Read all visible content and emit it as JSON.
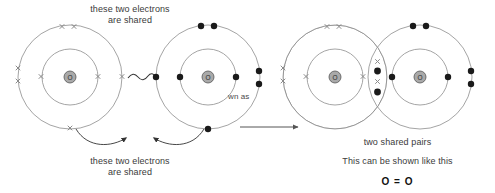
{
  "diagram": {
    "captions": {
      "top": "these two electrons\nare shared",
      "top_line1": "these two electrons",
      "top_line2": "are shared",
      "bottom_line1": "these two electrons",
      "bottom_line2": "are shared",
      "shown_as": "wn as",
      "two_shared_pairs": "two shared pairs",
      "shown_like_this": "This can be shown like this",
      "formula": "O = O"
    },
    "colors": {
      "shell_stroke": "#8d8d8d",
      "nucleus_fill": "#a9a9a9",
      "nucleus_stroke": "#555555",
      "dot_electron": "#1a1a1a",
      "cross_electron": "#8a8a8a",
      "arrow": "#555555",
      "text": "#3a3a3a",
      "formula_text": "#111111"
    },
    "left_group": {
      "label": "separate atoms",
      "atom_a": {
        "symbol": "O",
        "electron_mark": "cross",
        "cx": 70,
        "cy": 77,
        "inner_r": 28,
        "outer_r": 52,
        "inner_electrons": [
          {
            "angle": 180
          },
          {
            "angle": 0
          }
        ],
        "outer_electrons": [
          {
            "angle": 97
          },
          {
            "angle": 83
          },
          {
            "angle": 186
          },
          {
            "angle": 174
          },
          {
            "angle": 270
          },
          {
            "angle": 0
          }
        ]
      },
      "atom_b": {
        "symbol": "O",
        "electron_mark": "dot",
        "cx": 208,
        "cy": 77,
        "inner_r": 28,
        "outer_r": 52,
        "inner_electrons": [
          {
            "angle": 180
          },
          {
            "angle": 0
          }
        ],
        "outer_electrons": [
          {
            "angle": 97
          },
          {
            "angle": 83
          },
          {
            "angle": 6
          },
          {
            "angle": 354
          },
          {
            "angle": 270
          },
          {
            "angle": 180
          }
        ]
      },
      "squiggle": {
        "from_x": 122,
        "to_x": 156,
        "y": 77
      }
    },
    "right_group": {
      "label": "bonded molecule",
      "atom_a": {
        "symbol": "O",
        "electron_mark": "cross",
        "cx": 335,
        "cy": 77,
        "inner_r": 28,
        "outer_r": 52,
        "inner_electrons": [
          {
            "angle": 180
          },
          {
            "angle": 0
          }
        ],
        "outer_electrons": [
          {
            "angle": 97
          },
          {
            "angle": 83
          },
          {
            "angle": 186
          },
          {
            "angle": 174
          }
        ]
      },
      "atom_b": {
        "symbol": "O",
        "electron_mark": "dot",
        "cx": 420,
        "cy": 77,
        "inner_r": 28,
        "outer_r": 52,
        "inner_electrons": [
          {
            "angle": 180
          },
          {
            "angle": 0
          }
        ],
        "outer_electrons": [
          {
            "angle": 97
          },
          {
            "angle": 83
          },
          {
            "angle": 6
          },
          {
            "angle": 354
          }
        ]
      },
      "shared_electrons": [
        {
          "mark": "cross",
          "x": 378,
          "y": 62
        },
        {
          "mark": "dot",
          "x": 378,
          "y": 71
        },
        {
          "mark": "cross",
          "x": 378,
          "y": 82
        },
        {
          "mark": "dot",
          "x": 378,
          "y": 92
        }
      ]
    },
    "reaction_arrow": {
      "x1": 240,
      "y1": 127,
      "x2": 300,
      "y2": 127
    },
    "curved_arrows": [
      {
        "name": "left-electron-arrow",
        "from_x": 76,
        "from_y": 127,
        "to_x": 128,
        "to_y": 137
      },
      {
        "name": "right-electron-arrow",
        "from_x": 206,
        "from_y": 127,
        "to_x": 152,
        "to_y": 137
      }
    ]
  }
}
